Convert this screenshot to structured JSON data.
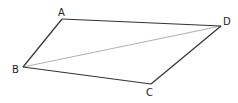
{
  "diagram": {
    "type": "parallelogram",
    "vertices": {
      "A": {
        "label": "A",
        "x": 62,
        "y": 19,
        "lx": 58,
        "ly": 16
      },
      "B": {
        "label": "B",
        "x": 23,
        "y": 67,
        "lx": 12,
        "ly": 73
      },
      "C": {
        "label": "C",
        "x": 151,
        "y": 84,
        "lx": 146,
        "ly": 96
      },
      "D": {
        "label": "D",
        "x": 221,
        "y": 26,
        "lx": 223,
        "ly": 25
      }
    },
    "edges": [
      [
        "A",
        "D"
      ],
      [
        "D",
        "C"
      ],
      [
        "C",
        "B"
      ],
      [
        "B",
        "A"
      ]
    ],
    "diagonals": [
      [
        "B",
        "D"
      ]
    ],
    "colors": {
      "edge": "#333333",
      "diagonal": "#b0b0b0"
    }
  }
}
